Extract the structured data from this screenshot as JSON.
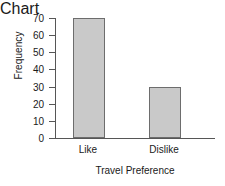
{
  "chart_data": {
    "type": "bar",
    "title": "",
    "subtitle": "",
    "categories": [
      "Like",
      "Dislike"
    ],
    "values": [
      70,
      30
    ],
    "series": [
      {
        "name": "Frequency",
        "values": [
          70,
          30
        ]
      }
    ],
    "xlabel": "Travel Preference",
    "ylabel": "Frequency",
    "ylim": [
      0,
      70
    ],
    "ytick_labels": [
      "70",
      "60",
      "50",
      "40",
      "30",
      "20",
      "10",
      "0"
    ],
    "ytick_values": [
      70,
      60,
      50,
      40,
      30,
      20,
      10,
      0
    ],
    "xtick_labels": [
      "Like",
      "Dislike"
    ],
    "grid": false,
    "legend": false,
    "legend_position": "none",
    "annotations": [],
    "colors": {
      "bar_fill": "#c9c9c9",
      "bar_edge": "#6d6d6d",
      "axis": "#565656",
      "text": "#1a1a1a",
      "background": "#ffffff"
    }
  }
}
